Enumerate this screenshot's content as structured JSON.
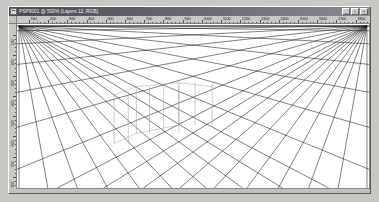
{
  "window": {
    "title": "PSP9001 @ 500% (Layers 12, RGB)",
    "app_icon_name": "image-document-icon",
    "buttons": [
      {
        "name": "minimize-button",
        "glyph": "_"
      },
      {
        "name": "maximize-button",
        "glyph": "▫"
      },
      {
        "name": "close-button",
        "glyph": "×"
      }
    ]
  },
  "rulers": {
    "horizontal": {
      "unit": "pixels",
      "labels": [
        "100",
        "200",
        "300",
        "400",
        "500",
        "600",
        "700",
        "800",
        "900",
        "1000",
        "1100",
        "1200",
        "1300",
        "1400",
        "1500",
        "1600",
        "1700",
        "1800"
      ]
    },
    "vertical": {
      "unit": "pixels",
      "labels": [
        "100",
        "200",
        "300",
        "400",
        "500",
        "600",
        "700",
        "800"
      ]
    }
  },
  "canvas": {
    "name": "perspective-grid-drawing",
    "description": "Two-point perspective line grid",
    "background": "#ffffff",
    "line_color": "#1a1a1a",
    "construction_color": "#a8a8a8",
    "vanishing_points": [
      {
        "name": "left-vanishing-point",
        "x": 2,
        "y": 2
      },
      {
        "name": "right-vanishing-point",
        "x": 346,
        "y": 2
      }
    ],
    "ray_count_left": 16,
    "ray_count_right": 16,
    "box_count": 3
  },
  "status": {
    "text": ""
  }
}
